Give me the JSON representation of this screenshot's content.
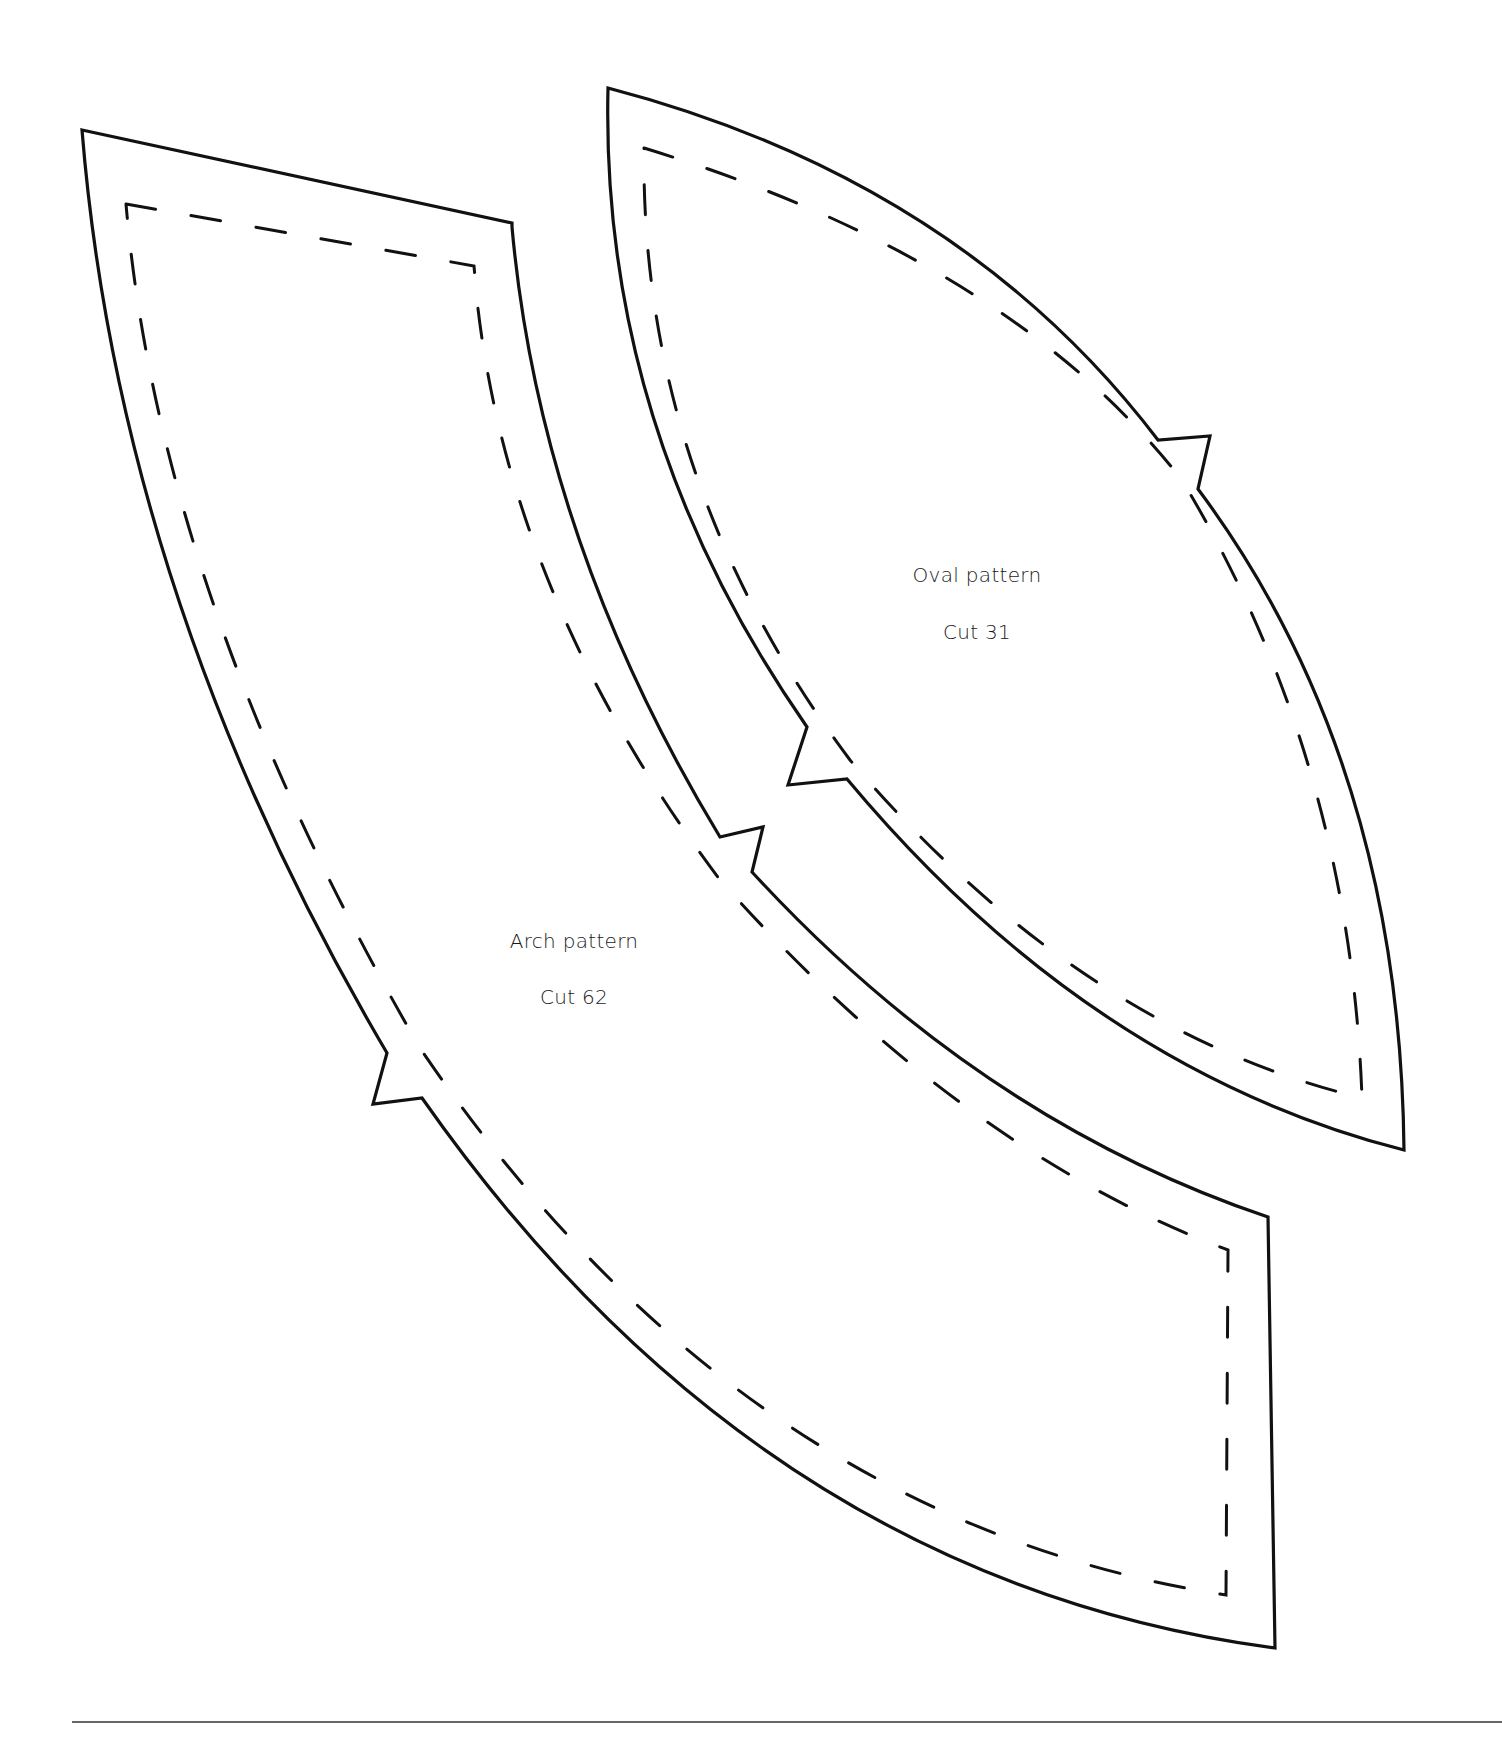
{
  "page": {
    "type": "sewing pattern template sheet",
    "background": "#ffffff",
    "ink_color": "#111111"
  },
  "patterns": [
    {
      "id": "oval",
      "title": "Oval pattern",
      "cut_label": "Cut 31",
      "shape": "pointed oval / vesica with two notches",
      "outline": "solid cut line",
      "seam_line": "dashed stitch line"
    },
    {
      "id": "arch",
      "title": "Arch pattern",
      "cut_label": "Cut 62",
      "shape": "curved arch segment with two notches",
      "outline": "solid cut line",
      "seam_line": "dashed stitch line"
    }
  ],
  "footer": {
    "rule": "horizontal divider line"
  }
}
